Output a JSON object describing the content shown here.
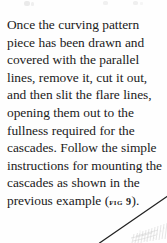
{
  "page": {
    "background_color": "#fefefe",
    "ink_color": "#1b1b1b",
    "width_px": 167,
    "height_px": 243
  },
  "body": {
    "paragraph_before_figure": "Once the curving pattern piece has been drawn and covered with the parallel lines, remove it, cut it out, and then slit the flare lines, opening them out to the fullness required for the cascades. Follow the simple instructions for mounting the cascades as shown in the previous example ",
    "open_paren": "(",
    "figure_reference": "FIG 9",
    "close_paren": ")",
    "terminal_period": ".",
    "lines": [
      "Once the curving pattern piece",
      "has been drawn and covered",
      "with the parallel lines, remove",
      "it, cut it out, and then slit the",
      "flare lines, opening them out to",
      "the fullness required for the",
      "cascades. Follow the simple",
      "instructions for mounting the",
      "cascades as shown in the",
      "previous example (FIG 9)."
    ]
  },
  "illustration": {
    "description": "diagonal-pen-line-with-hatching",
    "line_color": "#222222",
    "hatch_color": "#b9b9b9"
  }
}
